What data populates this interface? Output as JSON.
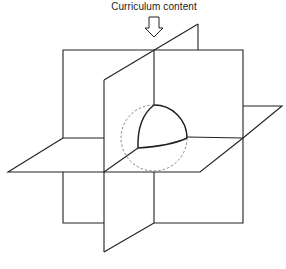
{
  "diagram": {
    "title": "Curriculum content",
    "elements": [
      {
        "name": "input-arrow",
        "description": "hollow downward arrow indicating curriculum content entering"
      },
      {
        "name": "frontal-plane",
        "description": "vertical plane facing viewer"
      },
      {
        "name": "sagittal-plane",
        "description": "vertical plane receding in depth"
      },
      {
        "name": "horizontal-plane",
        "description": "horizontal plane"
      },
      {
        "name": "sphere",
        "description": "dashed sphere at intersection of planes"
      },
      {
        "name": "octant-segment",
        "description": "solid highlighted spherical octant"
      }
    ],
    "colors": {
      "stroke": "#222222",
      "dashed": "#777777",
      "background": "#ffffff"
    }
  }
}
